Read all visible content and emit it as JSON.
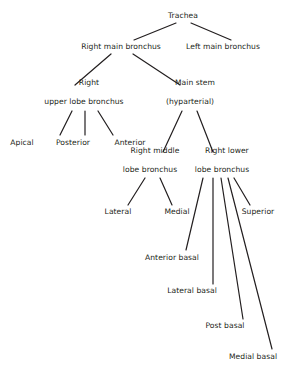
{
  "diagram": {
    "type": "tree",
    "background_color": "#ffffff",
    "text_color": "#231f20",
    "edge_color": "#231f20"
  },
  "nodes": {
    "trachea": {
      "label": "Trachea",
      "x": 183,
      "y": 16
    },
    "right_main_bronchus": {
      "label": "Right main bronchus",
      "x": 121,
      "y": 47
    },
    "left_main_bronchus": {
      "label": "Left main bronchus",
      "x": 223,
      "y": 47
    },
    "right_upper_lobe_bronchus": {
      "label_line1": "Right",
      "label_line2": "upper lobe bronchus",
      "x": 84,
      "y": 97
    },
    "main_stem": {
      "label_line1": "Main stem",
      "label_line2": "(hyparterial)",
      "x": 190,
      "y": 97
    },
    "apical": {
      "label": "Apical",
      "x": 22,
      "y": 143
    },
    "posterior": {
      "label": "Posterior",
      "x": 73,
      "y": 143
    },
    "anterior": {
      "label": "Anterior",
      "x": 130,
      "y": 143
    },
    "right_middle_lobe_bronchus": {
      "label_line1": "Right middle",
      "label_line2": "lobe bronchus",
      "x": 150,
      "y": 165
    },
    "right_lower_lobe_bronchus": {
      "label_line1": "Right lower",
      "label_line2": "lobe bronchus",
      "x": 222,
      "y": 165
    },
    "lateral": {
      "label": "Lateral",
      "x": 118,
      "y": 212
    },
    "medial": {
      "label": "Medial",
      "x": 177,
      "y": 212
    },
    "superior": {
      "label": "Superior",
      "x": 258,
      "y": 212
    },
    "anterior_basal": {
      "label": "Anterior basal",
      "x": 172,
      "y": 258
    },
    "lateral_basal": {
      "label": "Lateral basal",
      "x": 192,
      "y": 291
    },
    "post_basal": {
      "label": "Post basal",
      "x": 225,
      "y": 326
    },
    "medial_basal": {
      "label": "Medial basal",
      "x": 253,
      "y": 357
    }
  },
  "edges": [
    {
      "from": "trachea",
      "to": "right_main_bronchus",
      "x1": 176,
      "y1": 23,
      "x2": 134,
      "y2": 40
    },
    {
      "from": "trachea",
      "to": "left_main_bronchus",
      "x1": 191,
      "y1": 23,
      "x2": 231,
      "y2": 40
    },
    {
      "from": "right_main_bronchus",
      "to": "right_upper_lobe_bronchus",
      "x1": 111,
      "y1": 54,
      "x2": 75,
      "y2": 85
    },
    {
      "from": "right_main_bronchus",
      "to": "main_stem",
      "x1": 133,
      "y1": 54,
      "x2": 180,
      "y2": 85
    },
    {
      "from": "right_upper_lobe_bronchus",
      "to": "apical",
      "x1": 72,
      "y1": 111,
      "x2": 60,
      "y2": 135
    },
    {
      "from": "right_upper_lobe_bronchus",
      "to": "posterior",
      "x1": 85,
      "y1": 111,
      "x2": 85,
      "y2": 135
    },
    {
      "from": "right_upper_lobe_bronchus",
      "to": "anterior",
      "x1": 98,
      "y1": 111,
      "x2": 113,
      "y2": 135
    },
    {
      "from": "main_stem",
      "to": "right_middle_lobe_bronchus",
      "x1": 182,
      "y1": 111,
      "x2": 163,
      "y2": 152
    },
    {
      "from": "main_stem",
      "to": "right_lower_lobe_bronchus",
      "x1": 197,
      "y1": 111,
      "x2": 213,
      "y2": 152
    },
    {
      "from": "right_middle_lobe_bronchus",
      "to": "lateral",
      "x1": 145,
      "y1": 178,
      "x2": 128,
      "y2": 205
    },
    {
      "from": "right_middle_lobe_bronchus",
      "to": "medial",
      "x1": 160,
      "y1": 178,
      "x2": 172,
      "y2": 205
    },
    {
      "from": "right_lower_lobe_bronchus",
      "to": "superior",
      "x1": 234,
      "y1": 178,
      "x2": 250,
      "y2": 205
    },
    {
      "from": "right_lower_lobe_bronchus",
      "to": "anterior_basal",
      "x1": 203,
      "y1": 178,
      "x2": 186,
      "y2": 250
    },
    {
      "from": "right_lower_lobe_bronchus",
      "to": "lateral_basal",
      "x1": 213,
      "y1": 178,
      "x2": 213,
      "y2": 284
    },
    {
      "from": "right_lower_lobe_bronchus",
      "to": "post_basal",
      "x1": 221,
      "y1": 178,
      "x2": 243,
      "y2": 319
    },
    {
      "from": "right_lower_lobe_bronchus",
      "to": "medial_basal",
      "x1": 228,
      "y1": 178,
      "x2": 272,
      "y2": 349
    }
  ]
}
